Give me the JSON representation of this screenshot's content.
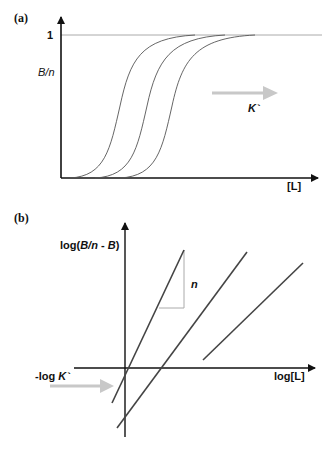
{
  "panel_a": {
    "label": "(a)",
    "y_axis_label": "B/n",
    "y_tick_one": "1",
    "x_axis_label": "[L]",
    "arrow_label": "K`",
    "curves": [
      {
        "name": "sigmoid-1",
        "midpoint_x": 120
      },
      {
        "name": "sigmoid-2",
        "midpoint_x": 147
      },
      {
        "name": "sigmoid-3",
        "midpoint_x": 172
      }
    ],
    "colors": {
      "axis": "#111111",
      "curve": "#555555",
      "asymptote": "#aaaaaa",
      "arrow": "#c8c8c8"
    }
  },
  "panel_b": {
    "label": "(b)",
    "y_axis_label_prefix": "log(",
    "y_axis_label_italic": "B/n",
    "y_axis_label_mid": " - ",
    "y_axis_label_italic2": "B",
    "y_axis_label_suffix": ")",
    "x_axis_label": "log[L]",
    "intercept_label_prefix": "-log ",
    "intercept_label_italic": "K`",
    "slope_label": "n",
    "lines": [
      {
        "name": "hill-line-1",
        "x1": 112,
        "y1": 403,
        "x2": 184,
        "y2": 250
      },
      {
        "name": "hill-line-2",
        "x1": 117,
        "y1": 428,
        "x2": 247,
        "y2": 252
      },
      {
        "name": "hill-line-3",
        "x1": 203,
        "y1": 360,
        "x2": 303,
        "y2": 263
      }
    ],
    "colors": {
      "axis": "#111111",
      "line": "#444444",
      "triangle": "#aaaaaa",
      "arrow": "#c8c8c8"
    }
  }
}
